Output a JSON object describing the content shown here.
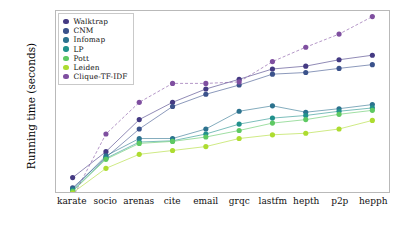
{
  "chart_data": {
    "type": "line",
    "title": "",
    "xlabel": "",
    "ylabel": "Running time (seconds)",
    "yscale": "log",
    "ylim": [
      0.01,
      1000
    ],
    "ytick_labels": [
      "10³",
      "10²",
      "10¹",
      "10⁰",
      "10⁻¹",
      "10⁻²"
    ],
    "ytick_values": [
      1000,
      100,
      10,
      1,
      0.1,
      0.01
    ],
    "grid": false,
    "legend_position": "upper-left",
    "categories": [
      "karate",
      "socio",
      "arenas",
      "cite",
      "email",
      "grqc",
      "lastfm",
      "hepth",
      "p2p",
      "hepph"
    ],
    "series": [
      {
        "name": "Walktrap",
        "color": "#443a83",
        "values": [
          0.025,
          0.13,
          1.0,
          3.0,
          7.0,
          13.0,
          25.0,
          30.0,
          45.0,
          60.0
        ]
      },
      {
        "name": "CNM",
        "color": "#3b528b",
        "values": [
          0.013,
          0.09,
          0.55,
          2.3,
          5.0,
          9.0,
          18.0,
          20.0,
          26.0,
          33.0
        ]
      },
      {
        "name": "Infomap",
        "color": "#2c728e",
        "values": [
          0.012,
          0.1,
          0.3,
          0.3,
          0.55,
          1.7,
          2.4,
          1.6,
          2.0,
          2.6
        ]
      },
      {
        "name": "LP",
        "color": "#21918c",
        "values": [
          0.011,
          0.085,
          0.24,
          0.26,
          0.4,
          0.75,
          1.1,
          1.3,
          1.7,
          2.1
        ]
      },
      {
        "name": "Pott",
        "color": "#5ec962",
        "values": [
          0.0105,
          0.08,
          0.22,
          0.25,
          0.33,
          0.5,
          0.8,
          1.0,
          1.4,
          1.8
        ]
      },
      {
        "name": "Leiden",
        "color": "#addc30",
        "values": [
          0.0095,
          0.045,
          0.11,
          0.14,
          0.18,
          0.3,
          0.38,
          0.42,
          0.55,
          0.95
        ]
      },
      {
        "name": "Clique-TF-IDF",
        "color": "#7f4fa0",
        "values": [
          0.007,
          0.4,
          3.0,
          10.0,
          10.0,
          11.0,
          40.0,
          100.0,
          230.0,
          700.0
        ]
      }
    ]
  }
}
